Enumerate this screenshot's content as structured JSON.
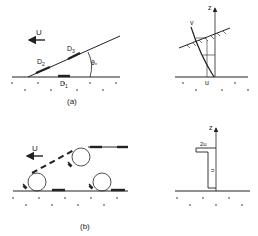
{
  "panel_a": {
    "caption": "(a)",
    "flow_label": "U",
    "deposits": [
      "D2",
      "D3",
      "D1"
    ],
    "deposit_labels": {
      "d1": "D",
      "d1_sub": "1",
      "d2": "D",
      "d2_sub": "2",
      "d3": "D",
      "d3_sub": "3"
    },
    "angle_label": "θ",
    "angle_sub": "*",
    "profile": {
      "axis_label": "z",
      "velocity_label": "v",
      "bottom_label": "u"
    }
  },
  "panel_b": {
    "caption": "(b)",
    "flow_label": "U",
    "profile": {
      "axis_label": "z",
      "upper_label": "2u",
      "lower_label": "u"
    }
  }
}
